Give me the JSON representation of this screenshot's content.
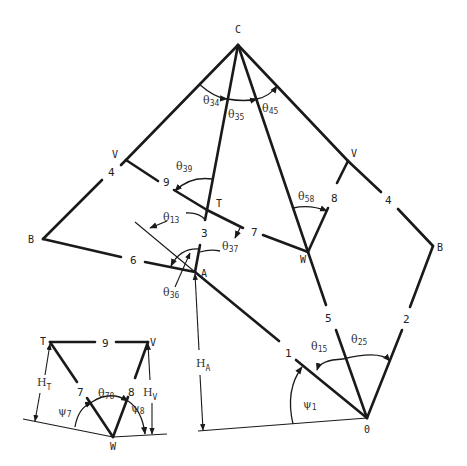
{
  "figure": {
    "type": "structural/kinematic geometry diagram",
    "colors": {
      "line": "#1a1a1a",
      "background": "#ffffff",
      "text": "#222222"
    }
  },
  "nodes": {
    "C": {
      "label": "C",
      "x": 238,
      "y": 45
    },
    "V_left": {
      "label": "V",
      "x": 126,
      "y": 160
    },
    "V_right": {
      "label": "V",
      "x": 348,
      "y": 161
    },
    "B_left": {
      "label": "B",
      "x": 43,
      "y": 239
    },
    "B_right": {
      "label": "B",
      "x": 433,
      "y": 246
    },
    "T": {
      "label": "T",
      "x": 207,
      "y": 210
    },
    "A": {
      "label": "A",
      "x": 195,
      "y": 272
    },
    "W": {
      "label": "W",
      "x": 308,
      "y": 252
    },
    "O": {
      "label": "0",
      "x": 367,
      "y": 418
    }
  },
  "members": [
    {
      "id": "4-left",
      "label": "4"
    },
    {
      "id": "4-right",
      "label": "4"
    },
    {
      "id": "9",
      "label": "9"
    },
    {
      "id": "3",
      "label": "3"
    },
    {
      "id": "7",
      "label": "7"
    },
    {
      "id": "8",
      "label": "8"
    },
    {
      "id": "6",
      "label": "6"
    },
    {
      "id": "5",
      "label": "5"
    },
    {
      "id": "1",
      "label": "1"
    },
    {
      "id": "2",
      "label": "2"
    }
  ],
  "angles": {
    "theta34": {
      "sym": "θ",
      "sub": "34"
    },
    "theta35": {
      "sym": "θ",
      "sub": "35"
    },
    "theta45": {
      "sym": "θ",
      "sub": "45"
    },
    "theta39": {
      "sym": "θ",
      "sub": "39"
    },
    "theta13": {
      "sym": "θ",
      "sub": "13"
    },
    "theta37": {
      "sym": "θ",
      "sub": "37"
    },
    "theta36": {
      "sym": "θ",
      "sub": "36"
    },
    "theta58": {
      "sym": "θ",
      "sub": "58"
    },
    "theta15": {
      "sym": "θ",
      "sub": "15"
    },
    "theta25": {
      "sym": "θ",
      "sub": "25"
    },
    "psi1": {
      "sym": "ψ",
      "sub": "1"
    },
    "theta78": {
      "sym": "θ",
      "sub": "78"
    },
    "psi7": {
      "sym": "ψ",
      "sub": "7"
    },
    "psi8": {
      "sym": "ψ",
      "sub": "8"
    }
  },
  "heights": {
    "HA": {
      "sym": "H",
      "sub": "A"
    },
    "HT": {
      "sym": "H",
      "sub": "T"
    },
    "HV": {
      "sym": "H",
      "sub": "V"
    }
  },
  "inset": {
    "nodes": {
      "T": "T",
      "V": "V",
      "W": "W"
    },
    "members": {
      "9": "9",
      "7": "7",
      "8": "8"
    }
  }
}
